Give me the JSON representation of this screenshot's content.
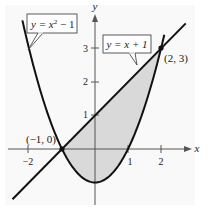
{
  "chart_data": {
    "type": "line",
    "title": "",
    "xlabel": "x",
    "ylabel": "y",
    "xlim": [
      -2.9,
      3.0
    ],
    "ylim": [
      -1.6,
      4.0
    ],
    "x_ticks": [
      -2,
      1,
      2
    ],
    "x_tick_labels": [
      "−2",
      "1",
      "2"
    ],
    "y_ticks": [
      1,
      2,
      3
    ],
    "y_tick_labels": [
      "1",
      "2",
      "3"
    ],
    "grid": false,
    "series": [
      {
        "name": "y = x² − 1",
        "equation": "y = x^2 - 1",
        "x_range": [
          -2.2,
          2.1
        ]
      },
      {
        "name": "y = x + 1",
        "equation": "y = x + 1",
        "x_range": [
          -2.5,
          2.75
        ]
      }
    ],
    "shaded_region": {
      "between": [
        "y = x + 1",
        "y = x² − 1"
      ],
      "x_from": -1,
      "x_to": 2,
      "color": "#d9d9d9"
    },
    "points": [
      {
        "x": -1,
        "y": 0,
        "label": "(−1, 0)"
      },
      {
        "x": 2,
        "y": 3,
        "label": "(2, 3)"
      }
    ],
    "annotations": [
      {
        "text_parts": [
          "y = x",
          "2",
          " − 1"
        ],
        "target": "parabola"
      },
      {
        "text": "y = x + 1",
        "target": "line"
      }
    ]
  },
  "labels": {
    "x_axis": "x",
    "y_axis": "y",
    "tick_x_m2": "−2",
    "tick_x_1": "1",
    "tick_x_2": "2",
    "tick_y_1": "1",
    "tick_y_2": "2",
    "tick_y_3": "3",
    "point_a": "(−1, 0)",
    "point_b": "(2, 3)",
    "parabola_eq_base": "y = x",
    "parabola_eq_exp": "2",
    "parabola_eq_tail": " − 1",
    "line_eq": "y = x + 1"
  },
  "colors": {
    "curve": "#111111",
    "shade": "#d9d9d9",
    "axis": "#555555",
    "background": "#f8f8f8"
  }
}
